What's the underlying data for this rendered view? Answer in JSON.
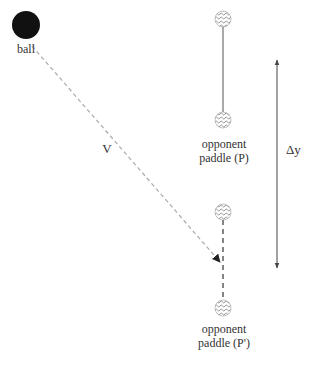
{
  "diagram": {
    "ball": {
      "label": "ball",
      "color": "#111111",
      "cx": 26,
      "cy": 25,
      "r": 14
    },
    "velocity": {
      "label": "V",
      "from": [
        30,
        45
      ],
      "to": [
        220,
        262
      ],
      "color": "#aaaaaa"
    },
    "paddle_p": {
      "label_line1": "opponent",
      "label_line2": "paddle (P)",
      "top": [
        223,
        19
      ],
      "bottom": [
        223,
        120
      ]
    },
    "paddle_p_prime": {
      "label_line1": "opponent",
      "label_line2": "paddle (P')",
      "top": [
        223,
        212
      ],
      "bottom": [
        223,
        308
      ]
    },
    "delta_y": {
      "label": "Δy",
      "x": 277,
      "y_top": 58,
      "y_bottom": 270
    }
  }
}
